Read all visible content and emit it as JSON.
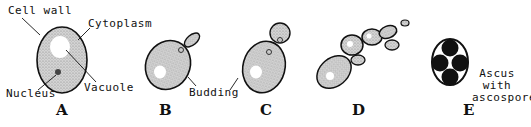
{
  "panels": [
    {
      "id": "A",
      "letter": "A",
      "labels": [
        "Cell wall",
        "Cytoplasm",
        "Vacuole",
        "Nucleus"
      ]
    },
    {
      "id": "B",
      "letter": "B"
    },
    {
      "id": "C",
      "letter": "C"
    },
    {
      "id": "D",
      "letter": "D"
    },
    {
      "id": "E",
      "letter": "E",
      "labels": [
        "Ascus with ascospores"
      ]
    }
  ],
  "labels": {
    "cell_wall": "Cell wall",
    "cytoplasm": "Cytoplasm",
    "vacuole": "Vacuole",
    "nucleus": "Nucleus",
    "budding": "Budding",
    "ascus_line1": "Ascus",
    "ascus_line2": "with",
    "ascus_line3": "ascospores"
  },
  "letters": {
    "a": "A",
    "b": "B",
    "c": "C",
    "d": "D",
    "e": "E"
  },
  "colors": {
    "outline": "#111111",
    "cytoplasm": "#c8c8c8",
    "vacuole": "#ffffff",
    "spore": "#111111"
  }
}
